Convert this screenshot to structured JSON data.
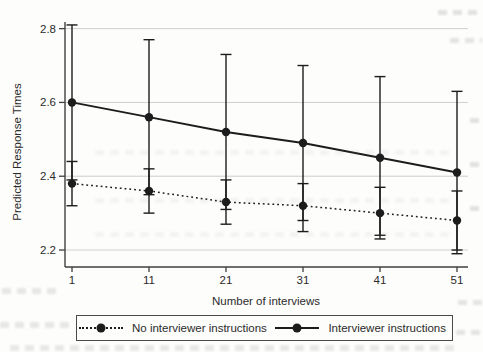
{
  "figure": {
    "y_axis_title": "Predicted Response Times",
    "x_axis_title": "Number of interviews",
    "y_tick_labels": [
      "2.8",
      "2.6",
      "2.4",
      "2.2"
    ],
    "x_tick_labels": [
      "1",
      "11",
      "21",
      "31",
      "41",
      "51"
    ]
  },
  "legend": {
    "items": [
      {
        "label": "No interviewer instructions",
        "line_style": "dotted",
        "marker": "filled-circle"
      },
      {
        "label": "Interviewer instructions",
        "line_style": "solid",
        "marker": "filled-circle"
      }
    ]
  },
  "chart_data": {
    "type": "line",
    "title": "",
    "xlabel": "Number of interviews",
    "ylabel": "Predicted Response Times",
    "x": [
      1,
      11,
      21,
      31,
      41,
      51
    ],
    "y_ticks": [
      2.2,
      2.4,
      2.6,
      2.8
    ],
    "ylim": [
      2.15,
      2.84
    ],
    "xlim": [
      0,
      52
    ],
    "grid": "horizontal-light",
    "legend_position": "bottom-center-boxed",
    "error_bars": "capped-vertical",
    "series": [
      {
        "name": "No interviewer instructions",
        "line": "dotted",
        "marker": "circle",
        "values": [
          2.38,
          2.36,
          2.33,
          2.32,
          2.3,
          2.28
        ],
        "ci_low": [
          2.32,
          2.3,
          2.27,
          2.25,
          2.23,
          2.2
        ],
        "ci_high": [
          2.44,
          2.42,
          2.39,
          2.38,
          2.37,
          2.36
        ]
      },
      {
        "name": "Interviewer instructions",
        "line": "solid",
        "marker": "circle",
        "values": [
          2.6,
          2.56,
          2.52,
          2.49,
          2.45,
          2.41
        ],
        "ci_low": [
          2.39,
          2.35,
          2.31,
          2.28,
          2.24,
          2.19
        ],
        "ci_high": [
          2.81,
          2.77,
          2.73,
          2.7,
          2.67,
          2.63
        ]
      }
    ],
    "colors": {
      "series": "#1c1c1c",
      "axis": "#3f3f3f",
      "grid": "#cacaca",
      "tick_text": "#2b2b2b",
      "background": "#fdfdfb"
    }
  }
}
